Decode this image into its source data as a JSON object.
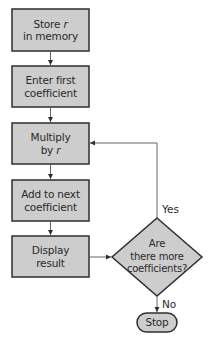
{
  "colors": {
    "fill": "#cdcdcd",
    "stroke": "#2e2e2e",
    "connector": "#555555",
    "text": "#2a2a2a"
  },
  "nodes": [
    {
      "id": "store-r",
      "shape": "rectangle",
      "line1": "Store ",
      "line1_italic": "r",
      "line2": "in memory"
    },
    {
      "id": "enter-first",
      "shape": "rectangle",
      "line1": "Enter first",
      "line2": "coefficient"
    },
    {
      "id": "multiply",
      "shape": "rectangle",
      "line1": "Multiply",
      "line2": "by ",
      "line2_italic": "r"
    },
    {
      "id": "add-next",
      "shape": "rectangle",
      "line1": "Add to next",
      "line2": "coefficient"
    },
    {
      "id": "display",
      "shape": "rectangle",
      "line1": "Display",
      "line2": "result"
    },
    {
      "id": "decision",
      "shape": "diamond",
      "line1": "Are",
      "line2": "there more",
      "line3": "coefficients?"
    },
    {
      "id": "stop",
      "shape": "terminator",
      "label": "Stop"
    }
  ],
  "edges": [
    {
      "from": "store-r",
      "to": "enter-first"
    },
    {
      "from": "enter-first",
      "to": "multiply"
    },
    {
      "from": "multiply",
      "to": "add-next"
    },
    {
      "from": "add-next",
      "to": "display"
    },
    {
      "from": "display",
      "to": "decision"
    },
    {
      "from": "decision",
      "to": "multiply",
      "label": "Yes"
    },
    {
      "from": "decision",
      "to": "stop",
      "label": "No"
    }
  ],
  "labels": {
    "yes": "Yes",
    "no": "No"
  }
}
